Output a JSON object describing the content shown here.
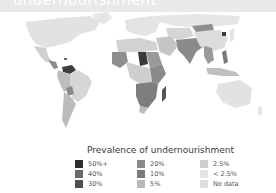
{
  "header": {
    "title": "undernourishment"
  },
  "map": {
    "type": "choropleth",
    "projection": "world",
    "regions": [
      {
        "name": "North America",
        "category": "< 2.5%"
      },
      {
        "name": "Mexico",
        "category": "5%"
      },
      {
        "name": "Central America",
        "category": "20%"
      },
      {
        "name": "Haiti",
        "category": "40%"
      },
      {
        "name": "Venezuela",
        "category": "30%"
      },
      {
        "name": "Andean South America",
        "category": "10%"
      },
      {
        "name": "Bolivia",
        "category": "20%"
      },
      {
        "name": "Brazil",
        "category": "2.5%"
      },
      {
        "name": "Southern Cone",
        "category": "5%"
      },
      {
        "name": "Europe",
        "category": "< 2.5%"
      },
      {
        "name": "North Africa",
        "category": "2.5%"
      },
      {
        "name": "Sahel",
        "category": "10%"
      },
      {
        "name": "Chad",
        "category": "40%"
      },
      {
        "name": "Central Africa",
        "category": "2.5%"
      },
      {
        "name": "East Africa",
        "category": "20%"
      },
      {
        "name": "Southern Africa",
        "category": "20%"
      },
      {
        "name": "Madagascar",
        "category": "40%"
      },
      {
        "name": "Middle East",
        "category": "5%"
      },
      {
        "name": "South Asia",
        "category": "20%"
      },
      {
        "name": "Mongolia",
        "category": "20%"
      },
      {
        "name": "North Korea",
        "category": "40%"
      },
      {
        "name": "Russia",
        "category": "< 2.5%"
      },
      {
        "name": "China",
        "category": "5%"
      },
      {
        "name": "Southeast Asia",
        "category": "10%"
      },
      {
        "name": "Philippines",
        "category": "20%"
      },
      {
        "name": "Indonesia",
        "category": "5%"
      },
      {
        "name": "Australia",
        "category": "< 2.5%"
      }
    ]
  },
  "legend": {
    "title": "Prevalence of undernourishment",
    "items": [
      {
        "label": "50%+",
        "color": "#2e2e2e"
      },
      {
        "label": "40%",
        "color": "#6a6a6a"
      },
      {
        "label": "30%",
        "color": "#4f4f4f"
      },
      {
        "label": "20%",
        "color": "#8a8a8a"
      },
      {
        "label": "10%",
        "color": "#7a7a7a"
      },
      {
        "label": "5%",
        "color": "#b9b9b9"
      },
      {
        "label": "2.5%",
        "color": "#cfcfcf"
      },
      {
        "label": "< 2.5%",
        "color": "#e4e4e4"
      },
      {
        "label": "No data",
        "color": "#dedede"
      }
    ]
  },
  "colors": {
    "land_default": "#e2e2e2",
    "banner": "#e9e9e9"
  }
}
